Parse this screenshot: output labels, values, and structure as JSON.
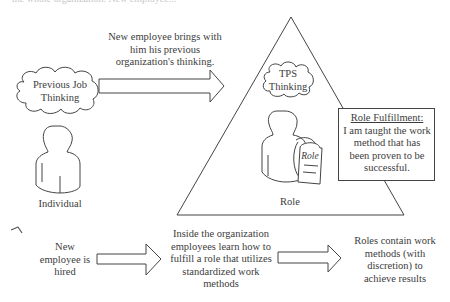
{
  "diagram": {
    "top_cut_text": "the whole organization. New employee...",
    "top_arrow_caption": [
      "New employee brings with",
      "him his previous",
      "organization's thinking."
    ],
    "previous_cloud": [
      "Previous Job",
      "Thinking"
    ],
    "individual_label": "Individual",
    "tps_cloud": [
      "TPS",
      "Thinking"
    ],
    "role_tag_label": "Role",
    "role_label": "Role",
    "role_box": {
      "title": "Role Fulfillment:",
      "lines": [
        "I am taught the work",
        "method that has",
        "been proven to be",
        "successful."
      ]
    },
    "bottom_steps": [
      {
        "lines": [
          "New",
          "employee is",
          "hired"
        ]
      },
      {
        "lines": [
          "Inside the organization",
          "employees learn how to",
          "fulfill a role that utilizes",
          "standardized work",
          "methods"
        ]
      },
      {
        "lines": [
          "Roles contain work",
          "methods (with",
          "discretion) to",
          "achieve results"
        ]
      }
    ],
    "colors": {
      "stroke": "#444444",
      "text": "#3c3c3c",
      "background": "#ffffff"
    }
  }
}
